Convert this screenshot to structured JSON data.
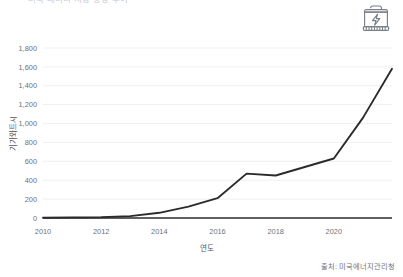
{
  "title": {
    "text": "미국 배터리 저장 용량 추이",
    "visible_partial": true
  },
  "icon": {
    "battery_label": "battery-bolt-icon"
  },
  "source": {
    "text": "출처: 미국에너지관리청"
  },
  "colors": {
    "line": "#2b2b2b",
    "grid": "#ededf1",
    "axis": "#2b2b2b",
    "tick_text": "#6e7279",
    "title_text": "#c9cbd0",
    "background": "#ffffff"
  },
  "chart_data": {
    "type": "line",
    "title": "미국 배터리 저장 용량 추이",
    "xlabel": "연도",
    "ylabel": "기가와트시",
    "x": [
      2010,
      2011,
      2012,
      2013,
      2014,
      2015,
      2016,
      2017,
      2018,
      2019,
      2020,
      2021,
      2022
    ],
    "values": [
      3,
      5,
      8,
      20,
      55,
      120,
      210,
      470,
      450,
      540,
      630,
      1060,
      1580
    ],
    "series": [
      {
        "name": "배터리 저장 용량",
        "values": [
          3,
          5,
          8,
          20,
          55,
          120,
          210,
          470,
          450,
          540,
          630,
          1060,
          1580
        ]
      }
    ],
    "xlim": [
      2010,
      2022
    ],
    "ylim": [
      0,
      1800
    ],
    "ytick_labels": [
      "0",
      "200",
      "400",
      "600",
      "800",
      "1,000",
      "1,200",
      "1,400",
      "1,600",
      "1,800"
    ],
    "ytick_values": [
      0,
      200,
      400,
      600,
      800,
      1000,
      1200,
      1400,
      1600,
      1800
    ],
    "xtick_labels": [
      "2010",
      "2012",
      "2014",
      "2016",
      "2018",
      "2020"
    ],
    "xtick_values": [
      2010,
      2012,
      2014,
      2016,
      2018,
      2020
    ],
    "grid": "horizontal",
    "legend": "none",
    "markers": false
  }
}
